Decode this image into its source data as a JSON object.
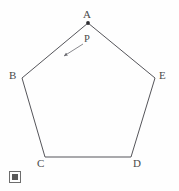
{
  "figure": {
    "background_color": "#fefefe",
    "stroke_color": "#55555a",
    "label_color": "#4a4a4a",
    "vertex_labels": {
      "A": "A",
      "B": "B",
      "C": "C",
      "D": "D",
      "E": "E"
    },
    "point_label": "P",
    "marker_label": "A",
    "footer_icon": "missing-glyph-icon"
  },
  "chart_data": {
    "type": "scatter",
    "xlabel": "",
    "ylabel": "",
    "grid": false,
    "legend": "none",
    "polygon": {
      "name": "pentagon ABCDE",
      "closed": true,
      "vertices": [
        {
          "label": "A",
          "x": 88,
          "y": 23
        },
        {
          "label": "B",
          "x": 22,
          "y": 78
        },
        {
          "label": "C",
          "x": 45,
          "y": 157
        },
        {
          "label": "D",
          "x": 131,
          "y": 157
        },
        {
          "label": "E",
          "x": 155,
          "y": 78
        }
      ]
    },
    "markers": [
      {
        "label": "A",
        "x": 88,
        "y": 23,
        "style": "filled-dot"
      }
    ],
    "annotations": [
      {
        "text": "P",
        "text_x": 88,
        "text_y": 40,
        "arrow_from_x": 83,
        "arrow_from_y": 44,
        "arrow_to_x": 64,
        "arrow_to_y": 56,
        "points_to": "edge AB"
      }
    ]
  }
}
